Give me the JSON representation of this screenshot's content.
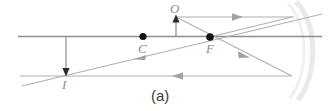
{
  "figure": {
    "caption": "(a)",
    "type": "ray-diagram",
    "colors": {
      "axis": "#8d8d8d",
      "ray": "#a8a8a8",
      "point": "#1a1a1a",
      "label": "#8e8e8e",
      "mirror": "#e4e4e4",
      "caption": "#3a3a3a",
      "background": "#ffffff"
    },
    "labels": [
      {
        "id": "O",
        "text": "O",
        "meaning": "object",
        "x": 176,
        "y": 8
      },
      {
        "id": "C",
        "text": "C",
        "meaning": "center-of-curvature",
        "x": 143,
        "y": 46
      },
      {
        "id": "F",
        "text": "F",
        "meaning": "focal-point",
        "x": 211,
        "y": 46
      },
      {
        "id": "I",
        "text": "I",
        "meaning": "image",
        "x": 66,
        "y": 82
      }
    ],
    "points": [
      {
        "id": "C",
        "x": 143,
        "y": 36.5,
        "radius": 3.6
      },
      {
        "id": "F",
        "x": 210,
        "y": 37,
        "radius": 3.6
      }
    ],
    "optical_axis": {
      "x1": 18,
      "y1": 36.5,
      "x2": 322,
      "y2": 36.5
    },
    "object_arrow": {
      "x": 176,
      "y_base": 36.5,
      "y_tip": 16,
      "direction": "up"
    },
    "image_arrow": {
      "x": 66,
      "y_base": 57,
      "y_tip": 78,
      "direction": "down"
    },
    "rays": [
      {
        "id": "incident-parallel-ray",
        "x1": 176,
        "y1": 17,
        "x2": 292,
        "y2": 17,
        "arrow_at": 0.53,
        "arrow_dir": "right"
      },
      {
        "id": "reflected-through-focus-ray",
        "x1": 292,
        "y1": 17,
        "x2": 243,
        "y2": 37,
        "arrow_at": 1.0,
        "arrow_dir": "none"
      },
      {
        "id": "ray-through-focus-to-mirror",
        "x1": 210,
        "y1": 37,
        "x2": 292,
        "y2": 76,
        "arrow_at": 0.45,
        "arrow_dir": "down-right"
      },
      {
        "id": "reflected-parallel-lower-ray",
        "x1": 292,
        "y1": 76,
        "x2": 20,
        "y2": 76,
        "arrow_at": 0.43,
        "arrow_dir": "left"
      },
      {
        "id": "long-diagonal-ray",
        "x1": 22,
        "y1": 86,
        "x2": 322,
        "y2": 14,
        "arrow_at": 0.4,
        "arrow_dir": "left"
      }
    ],
    "mirror_arc": {
      "cx": 120,
      "cy": 55,
      "rx": 185,
      "ry": 52,
      "description": "faint concave mirror surface at right"
    }
  }
}
